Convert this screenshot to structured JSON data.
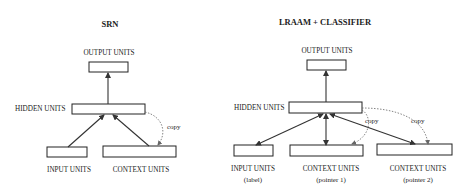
{
  "diagrams": [
    {
      "title": "SRN",
      "output_label": "OUTPUT UNITS",
      "hidden_label": "HIDDEN UNITS",
      "input_label": "INPUT UNITS",
      "context_label": "CONTEXT UNITS",
      "copy_label": "copy"
    },
    {
      "title": "LRAAM + CLASSIFIER",
      "output_label": "OUTPUT UNITS",
      "hidden_label": "HIDDEN UNITS",
      "input_label": "INPUT UNITS",
      "input_sub": "(label)",
      "context1_label": "CONTEXT UNITS",
      "context1_sub": "(pointer 1)",
      "context2_label": "CONTEXT UNITS",
      "context2_sub": "(pointer 2)",
      "copy1_label": "copy",
      "copy2_label": "copy"
    }
  ]
}
